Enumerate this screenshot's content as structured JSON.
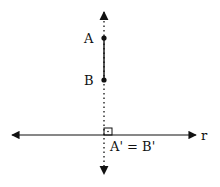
{
  "diagram": {
    "type": "orthogonal-projection",
    "points": {
      "A": {
        "label": "A",
        "x": 104,
        "y": 38
      },
      "B": {
        "label": "B",
        "x": 104,
        "y": 80
      }
    },
    "line_r": {
      "label": "r"
    },
    "projection_label": "A' = B'",
    "colors": {
      "stroke": "#111111",
      "background": "#ffffff"
    }
  }
}
